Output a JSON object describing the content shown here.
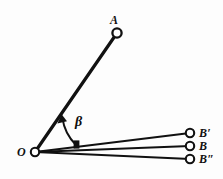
{
  "figure": {
    "kind": "geometry-diagram",
    "background_color": "#fdfdfd",
    "stroke_color": "#111111",
    "node_fill_color": "#ffffff"
  },
  "points": [
    {
      "id": "O",
      "label": "O",
      "x": 35,
      "y": 152,
      "label_x": 17,
      "label_y": 146,
      "radius": 4.2
    },
    {
      "id": "A",
      "label": "A",
      "x": 117,
      "y": 33,
      "label_x": 110,
      "label_y": 14,
      "radius": 4.6
    },
    {
      "id": "Bp",
      "label": "B′",
      "x": 190,
      "y": 133,
      "label_x": 199,
      "label_y": 127,
      "radius": 4.2
    },
    {
      "id": "B",
      "label": "B",
      "x": 190,
      "y": 146,
      "label_x": 199,
      "label_y": 140,
      "radius": 4.2
    },
    {
      "id": "Bpp",
      "label": "B″",
      "x": 190,
      "y": 159,
      "label_x": 199,
      "label_y": 153,
      "radius": 4.2
    }
  ],
  "segments": [
    {
      "id": "OA",
      "from": "O",
      "to": "A",
      "width": 3.2
    },
    {
      "id": "OBp",
      "from": "O",
      "to": "Bp",
      "width": 2.1
    },
    {
      "id": "OB",
      "from": "O",
      "to": "B",
      "width": 2.1
    },
    {
      "id": "OBpp",
      "from": "O",
      "to": "Bpp",
      "width": 2.1
    }
  ],
  "angle_arc": {
    "id": "beta-arc",
    "label": "β",
    "label_x": 75,
    "label_y": 115,
    "path": "M 76 145 C 70 139 64 129 62.5 118.5",
    "width": 1.9,
    "arrow_tip_x": 61.5,
    "arrow_tip_y": 115.5,
    "tick": {
      "x": 73.5,
      "y": 140.5,
      "w": 6,
      "h": 8
    }
  }
}
